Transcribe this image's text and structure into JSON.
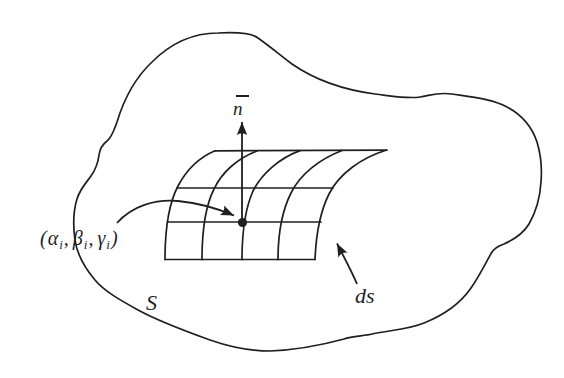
{
  "colors": {
    "ink": "#1f1f1f",
    "background": "#ffffff"
  },
  "labels": {
    "normal_vector": "n",
    "point": {
      "open": "(",
      "alpha": "α",
      "beta": "β",
      "gamma": "γ",
      "sub": "i",
      "comma": ",",
      "close": ")"
    },
    "surface": "S",
    "area_element": "ds"
  }
}
